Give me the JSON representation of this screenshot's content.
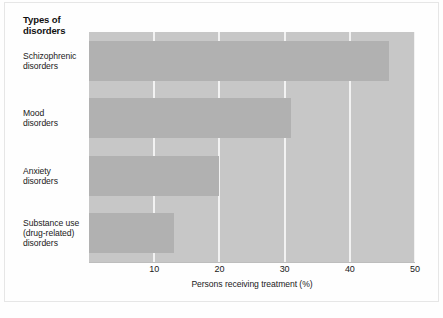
{
  "chart_data": {
    "type": "bar",
    "orientation": "horizontal",
    "title": "",
    "legend_title": "Types of disorders",
    "legend_title_lines": [
      "Types of",
      "disorders"
    ],
    "categories": [
      "Schizophrenic disorders",
      "Mood disorders",
      "Anxiety disorders",
      "Substance use (drug-related) disorders"
    ],
    "category_lines": [
      [
        "Schizophrenic",
        "disorders"
      ],
      [
        "Mood",
        "disorders"
      ],
      [
        "Anxiety",
        "disorders"
      ],
      [
        "Substance use",
        "(drug-related)",
        "disorders"
      ]
    ],
    "values": [
      46,
      31,
      20,
      13
    ],
    "xlabel": "Persons receiving treatment (%)",
    "ylabel": "Types of disorders",
    "xlim": [
      0,
      50
    ],
    "ylim": null,
    "xticks": [
      10,
      20,
      30,
      40,
      50
    ],
    "xtick_labels": [
      "10",
      "20",
      "30",
      "40",
      "50"
    ],
    "grid": "vertical-only",
    "legend_position": "none",
    "colors": {
      "plot_background": "#c7c7c7",
      "bar_fill": "#b1b1b1",
      "gridline": "#f2f2f2",
      "page_background": "#fefefe",
      "text": "#1a1a1a"
    }
  }
}
